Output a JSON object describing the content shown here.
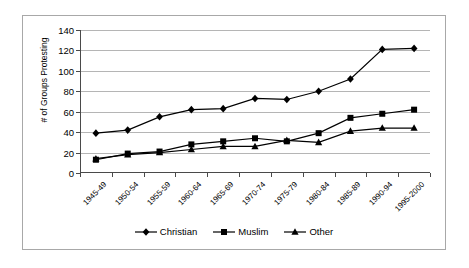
{
  "chart_data": {
    "type": "line",
    "title": "",
    "xlabel": "",
    "ylabel": "# of Groups Protesting",
    "ylim": [
      0,
      140
    ],
    "yticks": [
      0,
      20,
      40,
      60,
      80,
      100,
      120,
      140
    ],
    "grid": true,
    "legend_position": "bottom",
    "categories": [
      "1945-49",
      "1950-54",
      "1955-59",
      "1960-64",
      "1965-69",
      "1970-74",
      "1975-79",
      "1980-84",
      "1985-89",
      "1990-94",
      "1995-2000"
    ],
    "series": [
      {
        "name": "Christian",
        "marker": "diamond",
        "color": "#000000",
        "values": [
          39,
          42,
          55,
          62,
          63,
          73,
          72,
          80,
          92,
          121,
          122
        ]
      },
      {
        "name": "Muslim",
        "marker": "square",
        "color": "#000000",
        "values": [
          13,
          19,
          21,
          28,
          31,
          34,
          31,
          39,
          54,
          58,
          62
        ]
      },
      {
        "name": "Other",
        "marker": "triangle",
        "color": "#000000",
        "values": [
          14,
          18,
          20,
          23,
          26,
          26,
          32,
          30,
          41,
          44,
          44
        ]
      }
    ]
  },
  "figure": {
    "border_color": "#a8a8a8",
    "background": "#ffffff",
    "gridline_color": "#b5b5b5",
    "axis_color": "#4a4a4a"
  }
}
